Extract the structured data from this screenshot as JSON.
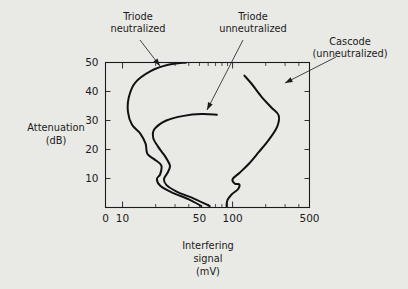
{
  "chart_data": {
    "type": "line",
    "title": "",
    "xlabel": "Interfering signal (mV)",
    "xlabel_lines": [
      "Interfering",
      "signal",
      "(mV)"
    ],
    "ylabel": "Attenuation (dB)",
    "ylabel_lines": [
      "Attenuation",
      "(dB)"
    ],
    "xscale": "log",
    "yscale": "linear",
    "xlim": [
      7,
      500
    ],
    "ylim": [
      0,
      50
    ],
    "grid": false,
    "legend": "annotations",
    "xticks": [
      {
        "label": "0",
        "value": 7
      },
      {
        "label": "10",
        "value": 10
      },
      {
        "label": "50",
        "value": 50
      },
      {
        "label": "100",
        "value": 100
      },
      {
        "label": "500",
        "value": 500
      }
    ],
    "yticks": [
      {
        "label": "10",
        "value": 10
      },
      {
        "label": "20",
        "value": 20
      },
      {
        "label": "30",
        "value": 30
      },
      {
        "label": "40",
        "value": 40
      },
      {
        "label": "50",
        "value": 50
      }
    ],
    "series": [
      {
        "name": "Triode neutralized",
        "annotation_lines": [
          "Triode",
          "neutralized"
        ],
        "points": [
          {
            "x": 38,
            "y": 50
          },
          {
            "x": 26,
            "y": 49.2
          },
          {
            "x": 18,
            "y": 47.0
          },
          {
            "x": 13.0,
            "y": 43.0
          },
          {
            "x": 11.4,
            "y": 38.0
          },
          {
            "x": 11.2,
            "y": 33.0
          },
          {
            "x": 12.2,
            "y": 28.5
          },
          {
            "x": 14.5,
            "y": 25.5
          },
          {
            "x": 16.2,
            "y": 22.0
          },
          {
            "x": 16.8,
            "y": 18.5
          },
          {
            "x": 19.5,
            "y": 16.6
          },
          {
            "x": 22.5,
            "y": 14.5
          },
          {
            "x": 22.0,
            "y": 11.5
          },
          {
            "x": 20.5,
            "y": 9.8
          },
          {
            "x": 22.0,
            "y": 7.5
          },
          {
            "x": 28.0,
            "y": 5.2
          },
          {
            "x": 40.0,
            "y": 2.8
          },
          {
            "x": 52.0,
            "y": 0.5
          }
        ]
      },
      {
        "name": "Triode unneutralized",
        "annotation_lines": [
          "Triode",
          "unneutralized"
        ],
        "points": [
          {
            "x": 72,
            "y": 32.0
          },
          {
            "x": 52,
            "y": 32.2
          },
          {
            "x": 36,
            "y": 31.6
          },
          {
            "x": 25,
            "y": 30.0
          },
          {
            "x": 19.5,
            "y": 27.0
          },
          {
            "x": 19.0,
            "y": 24.0
          },
          {
            "x": 21.0,
            "y": 21.0
          },
          {
            "x": 23.5,
            "y": 18.5
          },
          {
            "x": 25.5,
            "y": 16.4
          },
          {
            "x": 27.0,
            "y": 14.2
          },
          {
            "x": 25.5,
            "y": 11.8
          },
          {
            "x": 23.8,
            "y": 9.8
          },
          {
            "x": 25.0,
            "y": 7.8
          },
          {
            "x": 31.0,
            "y": 5.5
          },
          {
            "x": 45.0,
            "y": 3.0
          },
          {
            "x": 62.0,
            "y": 0.5
          }
        ]
      },
      {
        "name": "Cascode (unneutralized)",
        "annotation_lines": [
          "Cascode",
          "(unneutralized)"
        ],
        "points": [
          {
            "x": 128,
            "y": 45.5
          },
          {
            "x": 150,
            "y": 42.5
          },
          {
            "x": 185,
            "y": 38.0
          },
          {
            "x": 225,
            "y": 34.5
          },
          {
            "x": 262,
            "y": 31.8
          },
          {
            "x": 255,
            "y": 28.0
          },
          {
            "x": 215,
            "y": 23.5
          },
          {
            "x": 172,
            "y": 19.0
          },
          {
            "x": 140,
            "y": 15.0
          },
          {
            "x": 116,
            "y": 12.0
          },
          {
            "x": 100,
            "y": 9.8
          },
          {
            "x": 105,
            "y": 8.2
          },
          {
            "x": 115,
            "y": 8.0
          },
          {
            "x": 112,
            "y": 6.3
          },
          {
            "x": 98,
            "y": 4.5
          },
          {
            "x": 90,
            "y": 2.6
          },
          {
            "x": 88,
            "y": 0.5
          }
        ]
      }
    ]
  }
}
